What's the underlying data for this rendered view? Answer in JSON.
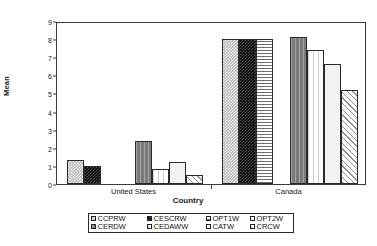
{
  "chart_data": {
    "type": "bar",
    "title": "",
    "xlabel": "Country",
    "ylabel": "Mean",
    "categories": [
      "United States",
      "Canada"
    ],
    "ylim": [
      0,
      9
    ],
    "yticks": [
      0,
      1,
      2,
      3,
      4,
      5,
      6,
      7,
      8,
      9
    ],
    "grid": false,
    "legend_position": "bottom",
    "series": [
      {
        "name": "CCPRW",
        "pattern": "checker-light",
        "values": [
          1.35,
          8.0
        ]
      },
      {
        "name": "CESCRW",
        "pattern": "checker-black",
        "values": [
          1.0,
          8.0
        ]
      },
      {
        "name": "OPT1W",
        "pattern": "horizontal-lines",
        "values": [
          0.0,
          8.0
        ]
      },
      {
        "name": "OPT2W",
        "pattern": "solid-white",
        "values": [
          0.0,
          0.0
        ]
      },
      {
        "name": "CERDW",
        "pattern": "vertical-gray",
        "values": [
          2.4,
          8.1
        ]
      },
      {
        "name": "CEDAWW",
        "pattern": "vertical-fine-white",
        "values": [
          0.85,
          7.4
        ]
      },
      {
        "name": "CATW",
        "pattern": "dotted",
        "values": [
          1.2,
          6.6
        ]
      },
      {
        "name": "CRCW",
        "pattern": "diagonal-hatch",
        "values": [
          0.5,
          5.2
        ]
      }
    ]
  },
  "axis": {
    "y_tick_labels": [
      "0",
      "1",
      "2",
      "3",
      "4",
      "5",
      "6",
      "7",
      "8",
      "9"
    ],
    "y_title": "Mean",
    "x_title": "Country",
    "x_group_labels": [
      "United States",
      "Canada"
    ]
  },
  "legend": {
    "row1": [
      {
        "label": "CCPRW"
      },
      {
        "label": "CESCRW"
      },
      {
        "label": "OPT1W"
      },
      {
        "label": "OPT2W"
      }
    ],
    "row2": [
      {
        "label": "CERDW"
      },
      {
        "label": "CEDAWW"
      },
      {
        "label": "CATW"
      },
      {
        "label": "CRCW"
      }
    ]
  }
}
